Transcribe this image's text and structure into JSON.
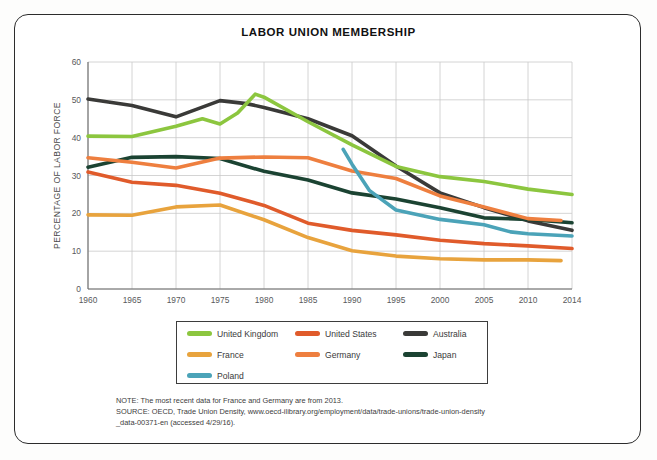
{
  "chart_data": {
    "type": "line",
    "title": "LABOR UNION MEMBERSHIP",
    "xlabel": "",
    "ylabel": "PERCENTAGE OF LABOR FORCE",
    "xlim": [
      1960,
      2014
    ],
    "ylim": [
      0,
      60
    ],
    "ytick_labels": [
      "0",
      "10",
      "20",
      "30",
      "40",
      "50",
      "60"
    ],
    "yticks": [
      0,
      10,
      20,
      30,
      40,
      50,
      60
    ],
    "xticks": [
      1960,
      1965,
      1970,
      1975,
      1980,
      1985,
      1990,
      1995,
      2000,
      2005,
      2010,
      2014
    ],
    "xtick_labels": [
      "1960",
      "1965",
      "1970",
      "1975",
      "1980",
      "1985",
      "1990",
      "1995",
      "2000",
      "2005",
      "2010",
      "2014"
    ],
    "grid": true,
    "legend_position": "bottom",
    "series": [
      {
        "name": "United Kingdom",
        "color": "#8CC63F",
        "x": [
          1960,
          1965,
          1970,
          1973,
          1975,
          1977,
          1979,
          1980,
          1985,
          1990,
          1995,
          2000,
          2005,
          2010,
          2014
        ],
        "values": [
          40.4,
          40.3,
          43.0,
          45.0,
          43.6,
          46.5,
          51.5,
          50.7,
          44.2,
          38.1,
          32.4,
          29.7,
          28.4,
          26.4,
          25.0
        ]
      },
      {
        "name": "United States",
        "color": "#E05B2B",
        "x": [
          1960,
          1965,
          1970,
          1975,
          1980,
          1985,
          1990,
          1995,
          2000,
          2005,
          2010,
          2014
        ],
        "values": [
          30.9,
          28.2,
          27.4,
          25.3,
          22.1,
          17.4,
          15.5,
          14.3,
          12.9,
          12.0,
          11.4,
          10.7
        ]
      },
      {
        "name": "Australia",
        "color": "#3A3A38",
        "x": [
          1960,
          1965,
          1970,
          1975,
          1978,
          1980,
          1985,
          1990,
          1995,
          2000,
          2005,
          2010,
          2014
        ],
        "values": [
          50.2,
          48.5,
          45.5,
          49.8,
          49.0,
          48.0,
          45.0,
          40.5,
          32.5,
          25.4,
          21.5,
          18.0,
          15.5
        ]
      },
      {
        "name": "France",
        "color": "#E8A33D",
        "x": [
          1960,
          1965,
          1970,
          1975,
          1980,
          1985,
          1990,
          1995,
          2000,
          2005,
          2010,
          2013
        ],
        "values": [
          19.6,
          19.5,
          21.7,
          22.2,
          18.3,
          13.6,
          10.1,
          8.7,
          8.0,
          7.7,
          7.7,
          7.5
        ]
      },
      {
        "name": "Germany",
        "color": "#EE7F3F",
        "x": [
          1960,
          1965,
          1970,
          1975,
          1980,
          1985,
          1990,
          1995,
          2000,
          2005,
          2010,
          2013
        ],
        "values": [
          34.7,
          33.5,
          32.0,
          34.6,
          34.9,
          34.7,
          31.2,
          29.2,
          24.6,
          21.7,
          18.6,
          18.1
        ]
      },
      {
        "name": "Japan",
        "color": "#1B4332",
        "x": [
          1960,
          1965,
          1970,
          1975,
          1980,
          1985,
          1990,
          1995,
          2000,
          2005,
          2010,
          2014
        ],
        "values": [
          32.2,
          34.8,
          35.0,
          34.5,
          31.1,
          28.8,
          25.4,
          23.8,
          21.5,
          18.8,
          18.4,
          17.5
        ]
      },
      {
        "name": "Poland",
        "color": "#4BA3B8",
        "x": [
          1989,
          1990,
          1992,
          1995,
          2000,
          2005,
          2008,
          2010,
          2014
        ],
        "values": [
          36.9,
          33.0,
          26.0,
          20.9,
          18.4,
          17.0,
          15.1,
          14.6,
          14.0
        ]
      }
    ]
  },
  "legend": {
    "items": [
      {
        "label": "United Kingdom",
        "color": "#8CC63F"
      },
      {
        "label": "United States",
        "color": "#E05B2B"
      },
      {
        "label": "Australia",
        "color": "#3A3A38"
      },
      {
        "label": "France",
        "color": "#E8A33D"
      },
      {
        "label": "Germany",
        "color": "#EE7F3F"
      },
      {
        "label": "Japan",
        "color": "#1B4332"
      },
      {
        "label": "Poland",
        "color": "#4BA3B8"
      }
    ]
  },
  "notes": {
    "lines": [
      "NOTE: The most recent data for France and Germany are from 2013.",
      "SOURCE: OECD, Trade Union Density, www.oecd-ilibrary.org/employment/data/trade-unions/trade-union-density",
      "_data-00371-en (accessed 4/29/16)."
    ]
  }
}
